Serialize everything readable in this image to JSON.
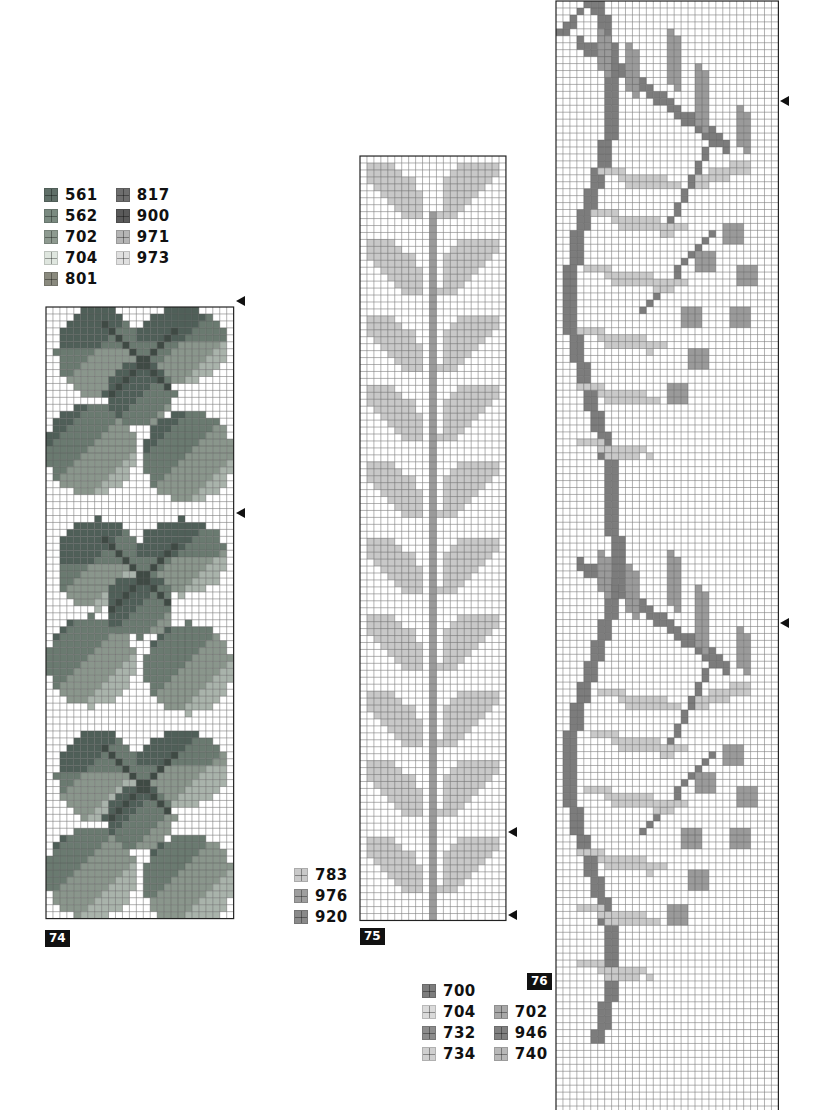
{
  "grid": {
    "line_color": "#555555",
    "bg": "#ffffff",
    "border": "#222222"
  },
  "charts": [
    {
      "id": "74",
      "label": "74",
      "x": 45,
      "y": 306,
      "cols": 27,
      "rows": 88,
      "cell": 6.95,
      "label_pos": {
        "x": 45,
        "y": 930
      },
      "arrows": [
        {
          "x": 236,
          "y": 301
        },
        {
          "x": 236,
          "y": 513
        }
      ],
      "legend": {
        "x": 44,
        "y": 186,
        "columns": 2,
        "items": [
          {
            "code": "561",
            "color": "#5f6f68"
          },
          {
            "code": "817",
            "color": "#6e6e6e"
          },
          {
            "code": "562",
            "color": "#7a8a80"
          },
          {
            "code": "900",
            "color": "#5a5a5a"
          },
          {
            "code": "702",
            "color": "#8e9a90"
          },
          {
            "code": "971",
            "color": "#b5b5b5"
          },
          {
            "code": "704",
            "color": "#dfe6df"
          },
          {
            "code": "973",
            "color": "#e0e0e0"
          },
          {
            "code": "801",
            "color": "#8a8a7e"
          }
        ]
      }
    },
    {
      "id": "75",
      "label": "75",
      "x": 359,
      "y": 155,
      "cols": 21,
      "rows": 110,
      "cell": 6.95,
      "label_pos": {
        "x": 360,
        "y": 928
      },
      "arrows": [
        {
          "x": 508,
          "y": 832
        },
        {
          "x": 508,
          "y": 915
        }
      ],
      "legend": {
        "x": 294,
        "y": 866,
        "columns": 1,
        "items": [
          {
            "code": "783",
            "color": "#c9c9c9"
          },
          {
            "code": "976",
            "color": "#9e9e9e"
          },
          {
            "code": "920",
            "color": "#8a8a8a"
          }
        ]
      }
    },
    {
      "id": "76",
      "label": "76",
      "x": 555,
      "y": 0,
      "cols": 32,
      "rows": 160,
      "cell": 6.95,
      "label_pos": {
        "x": 527,
        "y": 973
      },
      "arrows": [
        {
          "x": 780,
          "y": 101
        },
        {
          "x": 780,
          "y": 623
        }
      ],
      "legend": {
        "x": 422,
        "y": 982,
        "columns": 2,
        "items": [
          {
            "code": "700",
            "color": "#7d7d7d"
          },
          {
            "code": "",
            "color": ""
          },
          {
            "code": "704",
            "color": "#dadada"
          },
          {
            "code": "702",
            "color": "#a8a8a8"
          },
          {
            "code": "732",
            "color": "#8c8c8c"
          },
          {
            "code": "946",
            "color": "#808080"
          },
          {
            "code": "734",
            "color": "#cfcfcf"
          },
          {
            "code": "740",
            "color": "#b8b8b8"
          }
        ]
      }
    }
  ]
}
